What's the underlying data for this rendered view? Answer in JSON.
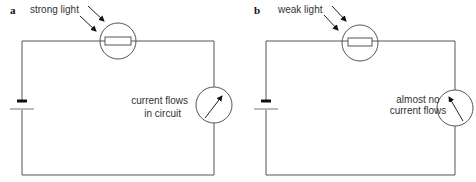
{
  "panels": [
    {
      "letter": "a",
      "light_label": "strong light",
      "meter_label_line1": "current flows",
      "meter_label_line2": "in circuit",
      "meter_needle": "deflected-right"
    },
    {
      "letter": "b",
      "light_label": "weak light",
      "meter_label_line1": "almost no",
      "meter_label_line2": "current flows",
      "meter_needle": "near-zero-left"
    }
  ],
  "colors": {
    "wire": "#555555",
    "text": "#333333",
    "background": "#ffffff"
  }
}
